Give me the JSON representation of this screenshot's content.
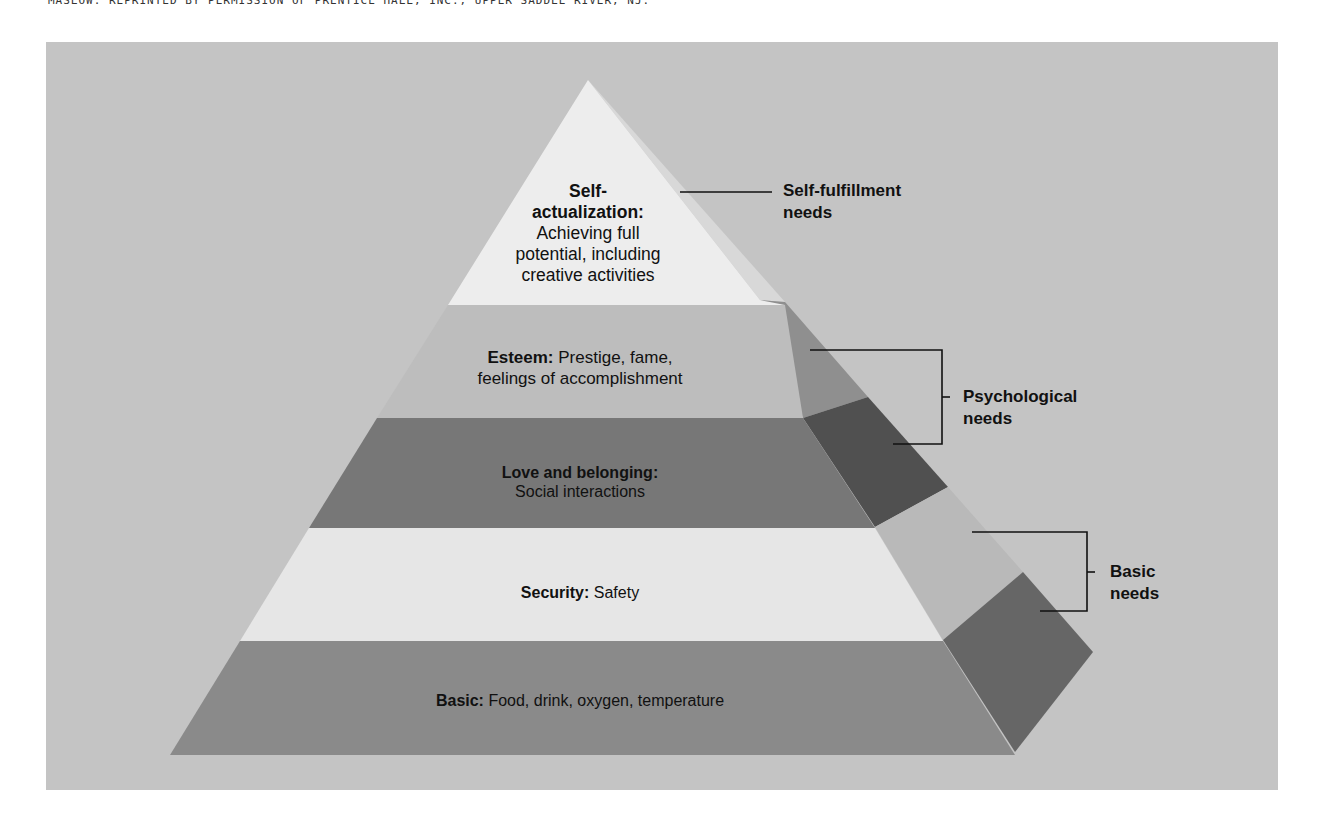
{
  "credit": "MASLOW. REPRINTED BY PERMISSION OF PRENTICE HALL, INC., UPPER SADDLE RIVER, NJ.",
  "colors": {
    "background_panel": "#c4c4c4",
    "self_actualization_front": "#ededed",
    "self_actualization_side": "#d8d8d8",
    "esteem_front": "#bdbdbd",
    "esteem_side": "#8f8f8f",
    "love_front": "#777777",
    "love_side": "#505050",
    "security_front": "#e6e6e6",
    "security_side": "#b9b9b9",
    "basic_front": "#8a8a8a",
    "basic_side": "#666666",
    "text": "#111111"
  },
  "levels": [
    {
      "name": "Self-actualization",
      "title_line1": "Self-",
      "title_line2": "actualization:",
      "desc_lines": [
        "Achieving full",
        "potential, including",
        "creative activities"
      ]
    },
    {
      "name": "Esteem",
      "title": "Esteem:",
      "desc_line1": " Prestige, fame,",
      "desc_line2": "feelings of accomplishment"
    },
    {
      "name": "Love and belonging",
      "title": "Love and belonging:",
      "desc": "Social interactions"
    },
    {
      "name": "Security",
      "title": "Security:",
      "desc": " Safety"
    },
    {
      "name": "Basic",
      "title": "Basic:",
      "desc": " Food, drink, oxygen, temperature"
    }
  ],
  "groups": [
    {
      "line1": "Self-fulfillment",
      "line2": "needs"
    },
    {
      "line1": "Psychological",
      "line2": "needs"
    },
    {
      "line1": "Basic",
      "line2": "needs"
    }
  ]
}
